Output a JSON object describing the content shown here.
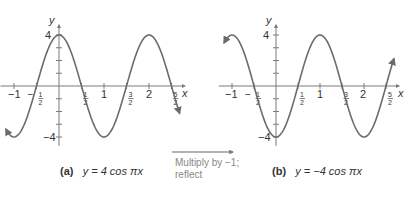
{
  "chart_data": [
    {
      "type": "line",
      "panel": "(a)",
      "title": "y = 4 cos πx",
      "function": "4*cos(pi*x)",
      "xlabel": "x",
      "ylabel": "y",
      "xlim": [
        -1.25,
        2.75
      ],
      "ylim": [
        -4.5,
        4.5
      ],
      "x_ticks": [
        "-1",
        "-1/2",
        "1/2",
        "1",
        "3/2",
        "2",
        "5/2"
      ],
      "y_ticks": [
        "4",
        "-4"
      ],
      "key_points": [
        [
          -1,
          -4
        ],
        [
          -0.5,
          0
        ],
        [
          0,
          4
        ],
        [
          0.5,
          0
        ],
        [
          1,
          -4
        ],
        [
          1.5,
          0
        ],
        [
          2,
          4
        ],
        [
          2.5,
          0
        ]
      ]
    },
    {
      "type": "line",
      "panel": "(b)",
      "title": "y = −4 cos πx",
      "function": "-4*cos(pi*x)",
      "xlabel": "x",
      "ylabel": "y",
      "xlim": [
        -1.25,
        2.75
      ],
      "ylim": [
        -4.5,
        4.5
      ],
      "x_ticks": [
        "-1",
        "-1/2",
        "1/2",
        "1",
        "3/2",
        "2",
        "5/2"
      ],
      "y_ticks": [
        "4",
        "-4"
      ],
      "key_points": [
        [
          -1,
          4
        ],
        [
          -0.5,
          0
        ],
        [
          0,
          -4
        ],
        [
          0.5,
          0
        ],
        [
          1,
          4
        ],
        [
          1.5,
          0
        ],
        [
          2,
          -4
        ],
        [
          2.5,
          0
        ]
      ]
    }
  ],
  "captions": {
    "a": {
      "id": "(a)",
      "eq": "y = 4 cos πx"
    },
    "b": {
      "id": "(b)",
      "eq": "y = −4 cos πx"
    }
  },
  "transform": {
    "line1": "Multiply by −1;",
    "line2": "reflect"
  },
  "axis": {
    "x": "x",
    "y": "y",
    "four": "4",
    "neg_four": "−4"
  },
  "ticks": {
    "neg1": "−1",
    "neg_half_num": "1",
    "half_den": "2",
    "one": "1",
    "two": "2",
    "three": "3",
    "five": "5",
    "minus": "−"
  },
  "colors": {
    "curve": "#6b6b6b",
    "axis": "#7a7a7a",
    "text": "#333333",
    "note": "#888888"
  }
}
